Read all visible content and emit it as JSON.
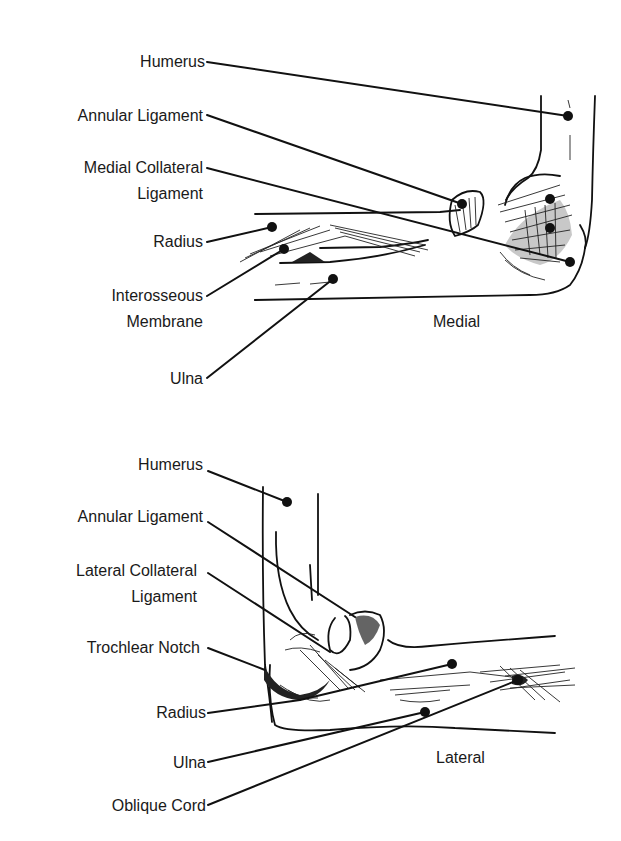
{
  "figure": {
    "medial": {
      "view_label": "Medial",
      "labels": [
        {
          "id": "humerus",
          "text": "Humerus"
        },
        {
          "id": "annular-ligament",
          "text": "Annular Ligament"
        },
        {
          "id": "medial-collateral-ligament",
          "line1": "Medial Collateral",
          "line2": "Ligament"
        },
        {
          "id": "radius",
          "text": "Radius"
        },
        {
          "id": "interosseous-membrane",
          "line1": "Interosseous",
          "line2": "Membrane"
        },
        {
          "id": "ulna",
          "text": "Ulna"
        }
      ]
    },
    "lateral": {
      "view_label": "Lateral",
      "labels": [
        {
          "id": "humerus",
          "text": "Humerus"
        },
        {
          "id": "annular-ligament",
          "text": "Annular Ligament"
        },
        {
          "id": "lateral-collateral-ligament",
          "line1": "Lateral Collateral",
          "line2": "Ligament"
        },
        {
          "id": "trochlear-notch",
          "text": "Trochlear Notch"
        },
        {
          "id": "radius",
          "text": "Radius"
        },
        {
          "id": "ulna",
          "text": "Ulna"
        },
        {
          "id": "oblique-cord",
          "text": "Oblique Cord"
        }
      ]
    }
  }
}
